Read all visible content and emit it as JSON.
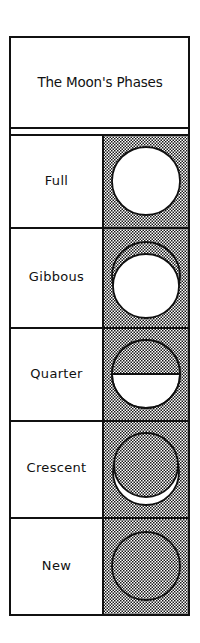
{
  "diagram": {
    "title": "The Moon's Phases",
    "colors": {
      "ink": "#111111",
      "paper": "#ffffff",
      "stipple": "#111111"
    },
    "rows": [
      {
        "label": "Full",
        "phase": "full",
        "icon": "full-moon-icon"
      },
      {
        "label": "Gibbous",
        "phase": "gibbous",
        "icon": "gibbous-moon-icon"
      },
      {
        "label": "Quarter",
        "phase": "quarter",
        "icon": "quarter-moon-icon"
      },
      {
        "label": "Crescent",
        "phase": "crescent",
        "icon": "crescent-moon-icon"
      },
      {
        "label": "New",
        "phase": "new",
        "icon": "new-moon-icon"
      }
    ]
  }
}
